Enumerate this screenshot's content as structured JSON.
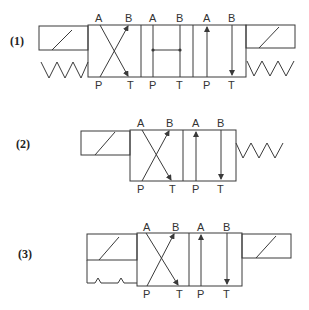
{
  "diagrams": [
    {
      "label": "(1)",
      "description": "4/3 directional valve, solenoid + spring both sides, H-center (tandem-like junction)",
      "ports": {
        "left_top_A": "A",
        "left_top_B": "B",
        "left_bot_P": "P",
        "left_bot_T": "T",
        "mid_top_A": "A",
        "mid_top_B": "B",
        "mid_bot_P": "P",
        "mid_bot_T": "T",
        "right_top_A": "A",
        "right_top_B": "B",
        "right_bot_P": "P",
        "right_bot_T": "T"
      }
    },
    {
      "label": "(2)",
      "description": "4/2 directional valve, solenoid left, spring return right",
      "ports": {
        "left_top_A": "A",
        "left_top_B": "B",
        "left_bot_P": "P",
        "left_bot_T": "T",
        "right_top_A": "A",
        "right_top_B": "B",
        "right_bot_P": "P",
        "right_bot_T": "T"
      }
    },
    {
      "label": "(3)",
      "description": "4/2 directional valve, solenoid with detent left, solenoid right",
      "ports": {
        "left_top_A": "A",
        "left_top_B": "B",
        "left_bot_P": "P",
        "left_bot_T": "T",
        "right_top_A": "A",
        "right_top_B": "B",
        "right_bot_P": "P",
        "right_bot_T": "T"
      }
    }
  ],
  "colors": {
    "line": "#3a3a3a",
    "text": "#333333",
    "background": "#ffffff"
  }
}
